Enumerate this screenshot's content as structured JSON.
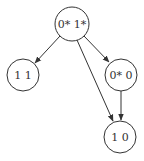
{
  "diagram": {
    "type": "directed-graph",
    "nodes": [
      {
        "id": "n0",
        "label": "0* 1*",
        "x": 72,
        "y": 24,
        "r": 17
      },
      {
        "id": "n1",
        "label": "1 1",
        "x": 23,
        "y": 75,
        "r": 16
      },
      {
        "id": "n2",
        "label": "0* 0",
        "x": 121,
        "y": 75,
        "r": 16
      },
      {
        "id": "n3",
        "label": "1 0",
        "x": 120,
        "y": 137,
        "r": 16
      }
    ],
    "edges": [
      {
        "from": "n0",
        "to": "n1"
      },
      {
        "from": "n0",
        "to": "n2"
      },
      {
        "from": "n0",
        "to": "n3"
      },
      {
        "from": "n2",
        "to": "n3"
      }
    ],
    "colors": {
      "stroke": "#333333",
      "background": "#ffffff"
    }
  }
}
